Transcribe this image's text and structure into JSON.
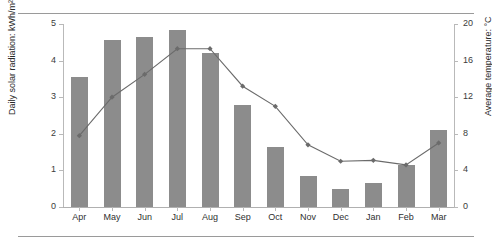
{
  "chart_data": {
    "type": "bar",
    "title": "",
    "xlabel": "",
    "categories": [
      "Apr",
      "May",
      "Jun",
      "Jul",
      "Aug",
      "Sep",
      "Oct",
      "Nov",
      "Dec",
      "Jan",
      "Feb",
      "Mar"
    ],
    "grid": false,
    "legend_position": "none",
    "series": [
      {
        "name": "Daily solar radiation",
        "type": "bar",
        "axis": "left",
        "units": "kWh/m²/d",
        "color": "#8c8c8c",
        "values": [
          3.55,
          4.55,
          4.65,
          4.85,
          4.2,
          2.8,
          1.65,
          0.85,
          0.5,
          0.65,
          1.15,
          2.1
        ]
      },
      {
        "name": "Average temperature",
        "type": "line",
        "axis": "right",
        "units": "°C",
        "color": "#6b6b6b",
        "marker": "diamond",
        "values": [
          7.8,
          12.0,
          14.5,
          17.3,
          17.3,
          13.2,
          11.0,
          6.8,
          5.0,
          5.1,
          4.6,
          7.0
        ]
      }
    ],
    "left_axis": {
      "label": "Daily solar radiation: kWh/m²/d",
      "ticks": [
        "0",
        "1",
        "2",
        "3",
        "4",
        "5"
      ],
      "tick_values": [
        0,
        1,
        2,
        3,
        4,
        5
      ],
      "ylim": [
        0,
        5
      ]
    },
    "right_axis": {
      "label": "Average temperature: °C",
      "ticks": [
        "0",
        "4",
        "8",
        "12",
        "16",
        "20"
      ],
      "tick_values": [
        0,
        4,
        8,
        12,
        16,
        20
      ],
      "ylim": [
        0,
        20
      ]
    }
  },
  "colors": {
    "bar": "#8c8c8c",
    "line": "#6b6b6b",
    "axis": "#b9b9b9",
    "rule": "#9a9a9a",
    "text": "#2f2f2f",
    "background": "#ffffff"
  }
}
